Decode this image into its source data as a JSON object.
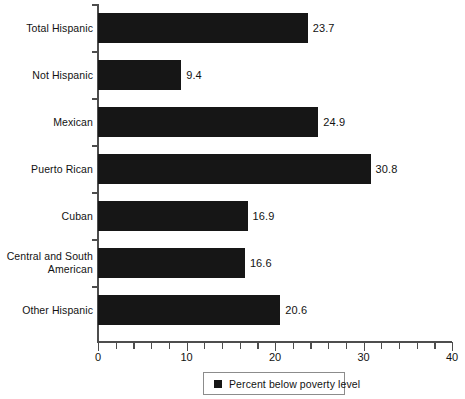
{
  "chart_data": {
    "type": "bar",
    "orientation": "horizontal",
    "title": "",
    "subtitle": "",
    "xlabel": "",
    "ylabel": "",
    "xlim": [
      0,
      40
    ],
    "xticks": [
      0,
      10,
      20,
      30,
      40
    ],
    "xtick_labels": [
      "0",
      "10",
      "20",
      "30",
      "40"
    ],
    "minor_tick_step": 2,
    "grid": false,
    "legend_position": "bottom-center",
    "bar_color": "#161616",
    "axis_color": "#4d4d4d",
    "categories": [
      "Total Hispanic",
      "Not Hispanic",
      "Mexican",
      "Puerto Rican",
      "Cuban",
      "Central and South American",
      "Other Hispanic"
    ],
    "values": [
      23.7,
      9.4,
      24.9,
      30.8,
      16.9,
      16.6,
      20.6
    ],
    "value_labels": [
      "23.7",
      "9.4",
      "24.9",
      "30.8",
      "16.9",
      "16.6",
      "20.6"
    ],
    "series": [
      {
        "name": "Percent below poverty level",
        "values": [
          23.7,
          9.4,
          24.9,
          30.8,
          16.9,
          16.6,
          20.6
        ]
      }
    ],
    "legend": [
      {
        "label": "Percent below poverty level",
        "color": "#161616",
        "marker": "square"
      }
    ]
  },
  "rows": [
    {
      "label_line1": "Total Hispanic",
      "label_line2": "",
      "value": "23.7"
    },
    {
      "label_line1": "Not Hispanic",
      "label_line2": "",
      "value": "9.4"
    },
    {
      "label_line1": "Mexican",
      "label_line2": "",
      "value": "24.9"
    },
    {
      "label_line1": "Puerto Rican",
      "label_line2": "",
      "value": "30.8"
    },
    {
      "label_line1": "Cuban",
      "label_line2": "",
      "value": "16.9"
    },
    {
      "label_line1": "Central and South",
      "label_line2": "American",
      "value": "16.6"
    },
    {
      "label_line1": "Other Hispanic",
      "label_line2": "",
      "value": "20.6"
    }
  ],
  "axis": {
    "tick_labels": [
      "0",
      "10",
      "20",
      "30",
      "40"
    ]
  },
  "legend": {
    "label": "Percent below poverty level"
  }
}
